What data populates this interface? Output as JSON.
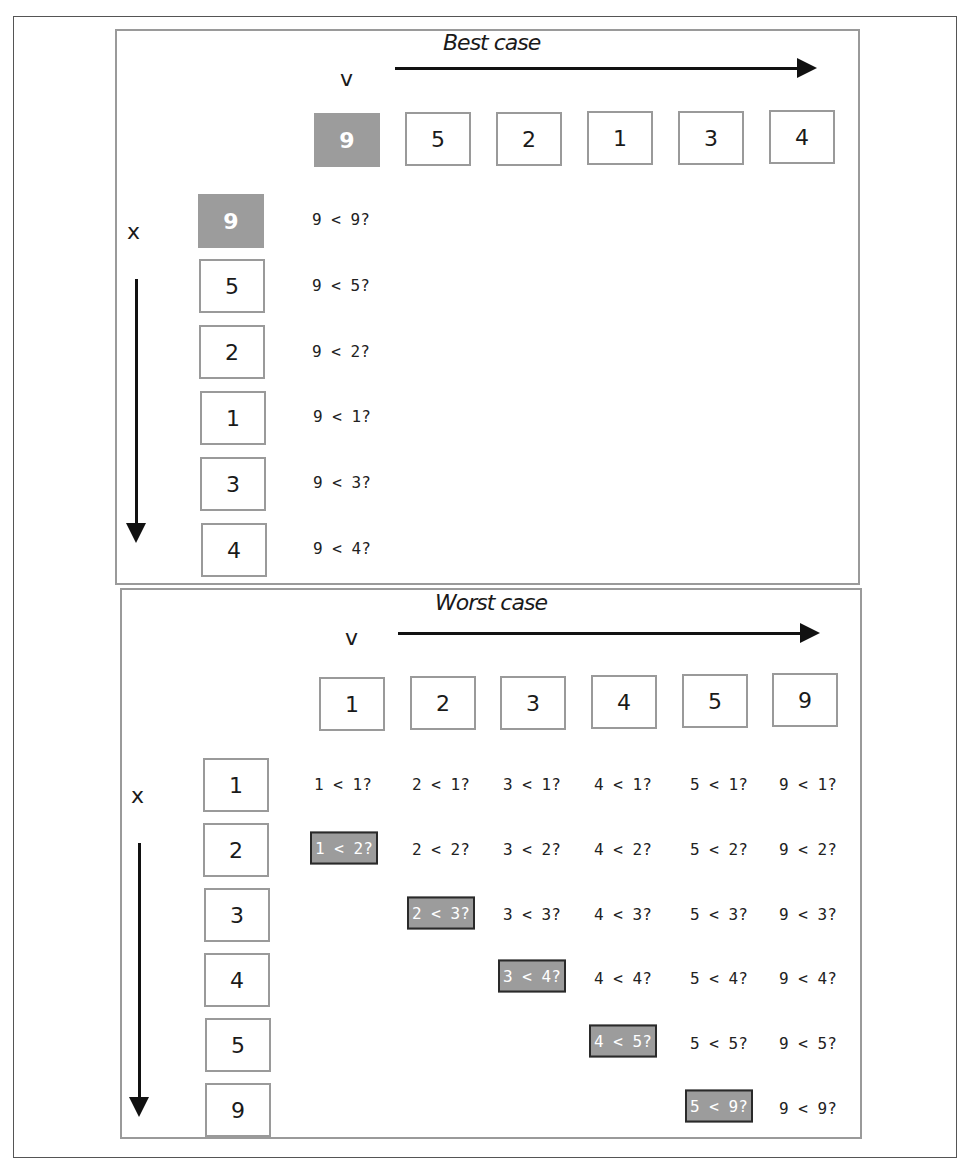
{
  "colors": {
    "highlight_fill": "#9c9c9c",
    "highlight_border": "#2a2a2a",
    "box_border": "#9a9a9a",
    "text": "#1a1a1a"
  },
  "best_case": {
    "title": "Best case",
    "v_label": "v",
    "x_label": "x",
    "v_values": [
      "9",
      "5",
      "2",
      "1",
      "3",
      "4"
    ],
    "x_values": [
      "9",
      "5",
      "2",
      "1",
      "3",
      "4"
    ],
    "highlight_v_index": 0,
    "highlight_x_index": 0,
    "comparisons": [
      "9 < 9?",
      "9 < 5?",
      "9 < 2?",
      "9 < 1?",
      "9 < 3?",
      "9 < 4?"
    ]
  },
  "worst_case": {
    "title": "Worst case",
    "v_label": "v",
    "x_label": "x",
    "v_values": [
      "1",
      "2",
      "3",
      "4",
      "5",
      "9"
    ],
    "x_values": [
      "1",
      "2",
      "3",
      "4",
      "5",
      "9"
    ],
    "rows": [
      {
        "x": "1",
        "cells": [
          "1 < 1?",
          "2 < 1?",
          "3 < 1?",
          "4 < 1?",
          "5 < 1?",
          "9 < 1?"
        ],
        "highlight": null
      },
      {
        "x": "2",
        "cells": [
          "1 < 2?",
          "2 < 2?",
          "3 < 2?",
          "4 < 2?",
          "5 < 2?",
          "9 < 2?"
        ],
        "highlight": 0
      },
      {
        "x": "3",
        "cells": [
          "2 < 3?",
          "3 < 3?",
          "4 < 3?",
          "5 < 3?",
          "9 < 3?"
        ],
        "highlight": 0
      },
      {
        "x": "4",
        "cells": [
          "3 < 4?",
          "4 < 4?",
          "5 < 4?",
          "9 < 4?"
        ],
        "highlight": 0
      },
      {
        "x": "5",
        "cells": [
          "4 < 5?",
          "5 < 5?",
          "9 < 5?"
        ],
        "highlight": 0
      },
      {
        "x": "9",
        "cells": [
          "5 < 9?",
          "9 < 9?"
        ],
        "highlight": 0
      }
    ]
  }
}
